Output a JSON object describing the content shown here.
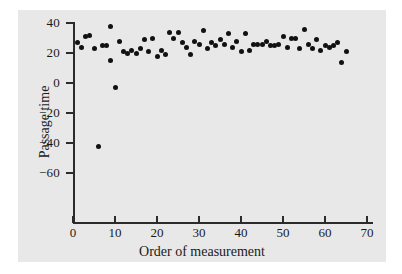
{
  "figure": {
    "background_color": "#e8e8e8",
    "page_background_color": "#ffffff",
    "axis_color": "#2b2b2b",
    "marker_color": "#111111"
  },
  "axes": {
    "x_title": "Order of measurement",
    "y_title": "Passage time",
    "x_ticks": [
      "0",
      "10",
      "20",
      "30",
      "40",
      "50",
      "60",
      "70"
    ],
    "y_ticks": [
      "40",
      "20",
      "0",
      "−20",
      "−40",
      "−60"
    ]
  },
  "chart_data": {
    "type": "scatter",
    "title": "",
    "subtitle": "",
    "xlabel": "Order of measurement",
    "ylabel": "Passage time",
    "xlim": [
      0,
      72
    ],
    "ylim": [
      -60,
      48
    ],
    "xticks": [
      0,
      10,
      20,
      30,
      40,
      50,
      60,
      70
    ],
    "yticks": [
      40,
      20,
      0,
      -20,
      -40,
      -60
    ],
    "grid": false,
    "legend": false,
    "legend_position": "none",
    "marker": "filled-circle",
    "series": [
      {
        "name": "Passage time",
        "x": [
          1,
          2,
          3,
          4,
          5,
          6,
          7,
          8,
          9,
          9,
          10,
          11,
          12,
          13,
          14,
          15,
          16,
          17,
          18,
          19,
          20,
          21,
          22,
          23,
          24,
          25,
          26,
          27,
          28,
          29,
          30,
          31,
          32,
          33,
          34,
          35,
          36,
          37,
          38,
          39,
          40,
          41,
          42,
          43,
          44,
          45,
          46,
          47,
          48,
          49,
          50,
          51,
          52,
          53,
          54,
          55,
          56,
          57,
          58,
          59,
          60,
          61,
          62,
          63,
          64,
          65
        ],
        "y": [
          27,
          24,
          31,
          32,
          23,
          -42,
          25,
          25,
          38,
          15,
          -3,
          28,
          21,
          20,
          22,
          20,
          23,
          29,
          21,
          30,
          18,
          22,
          19,
          34,
          30,
          34,
          27,
          24,
          19,
          28,
          26,
          35,
          23,
          27,
          25,
          29,
          26,
          33,
          24,
          28,
          21,
          33,
          22,
          26,
          26,
          26,
          28,
          25,
          25,
          26,
          31,
          24,
          30,
          30,
          23,
          36,
          26,
          23,
          29,
          22,
          25,
          24,
          25,
          27,
          14,
          21
        ]
      }
    ]
  }
}
